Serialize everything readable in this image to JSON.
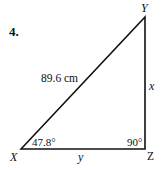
{
  "problem": {
    "number": "4."
  },
  "triangle": {
    "vertices": {
      "X": {
        "label": "X",
        "x": 21,
        "y": 149
      },
      "Y": {
        "label": "Y",
        "x": 145,
        "y": 17
      },
      "Z": {
        "label": "Z",
        "x": 145,
        "y": 149
      }
    },
    "sides": {
      "hypotenuse_XY": "89.6 cm",
      "side_YZ": "x",
      "side_XZ": "y"
    },
    "angles": {
      "X": "47.8°",
      "Z": "90°"
    },
    "stroke_color": "#111111"
  }
}
